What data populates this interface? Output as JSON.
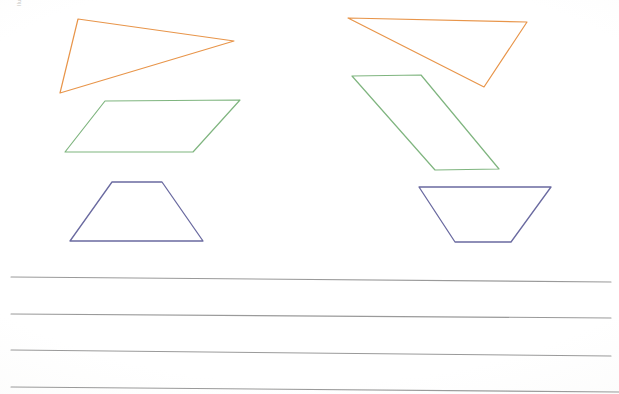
{
  "page": {
    "kind": "scanned-worksheet",
    "background_color": "#ffffff",
    "width": 619,
    "height": 394
  },
  "margin_label": {
    "text": "Ilustrações Alei DAE",
    "color": "#b9b9b5",
    "rotation_degrees": -90
  },
  "palette": {
    "orange": "#e8954a",
    "green": "#7fb57f",
    "blue": "#6a6aa0",
    "rule_gray": "#9a9a9a"
  },
  "figures": [
    {
      "name": "triangle-orange-left",
      "shape": "triangle",
      "color_key": "orange",
      "color": "#e8954a",
      "stroke_width": 1.2,
      "column": "left",
      "points": "78,19 234,41 60,93"
    },
    {
      "name": "parallelogram-green-left",
      "shape": "parallelogram",
      "color_key": "green",
      "color": "#7fb57f",
      "stroke_width": 1.2,
      "column": "left",
      "points": "105,101 240,100 193,152 65,152"
    },
    {
      "name": "trapezoid-blue-left",
      "shape": "trapezoid",
      "color_key": "blue",
      "color": "#6a6aa0",
      "stroke_width": 1.3,
      "column": "left",
      "points": "112,182 162,182 203,241 70,241"
    },
    {
      "name": "triangle-orange-right",
      "shape": "triangle",
      "color_key": "orange",
      "color": "#e8954a",
      "stroke_width": 1.2,
      "column": "right",
      "points": "348,18 527,22 484,87"
    },
    {
      "name": "parallelogram-green-right",
      "shape": "parallelogram",
      "color_key": "green",
      "color": "#7fb57f",
      "stroke_width": 1.2,
      "column": "right",
      "points": "352,76 421,75 499,169 435,170"
    },
    {
      "name": "trapezoid-blue-right",
      "shape": "trapezoid-inverted",
      "color_key": "blue",
      "color": "#6a6aa0",
      "stroke_width": 1.3,
      "column": "right",
      "points": "419,187 551,187 511,242 455,242"
    }
  ],
  "rule_lines": [
    {
      "name": "rule-line-1",
      "x1": 11,
      "y1": 277,
      "x2": 611,
      "y2": 282,
      "stroke_width": 1.1,
      "color": "#9a9a9a"
    },
    {
      "name": "rule-line-2",
      "x1": 11,
      "y1": 314,
      "x2": 611,
      "y2": 318,
      "stroke_width": 1.1,
      "color": "#9a9a9a"
    },
    {
      "name": "rule-line-3",
      "x1": 11,
      "y1": 350,
      "x2": 611,
      "y2": 356,
      "stroke_width": 1.1,
      "color": "#9a9a9a"
    },
    {
      "name": "rule-line-4",
      "x1": 11,
      "y1": 387,
      "x2": 619,
      "y2": 392,
      "stroke_width": 1.1,
      "color": "#9a9a9a"
    }
  ]
}
